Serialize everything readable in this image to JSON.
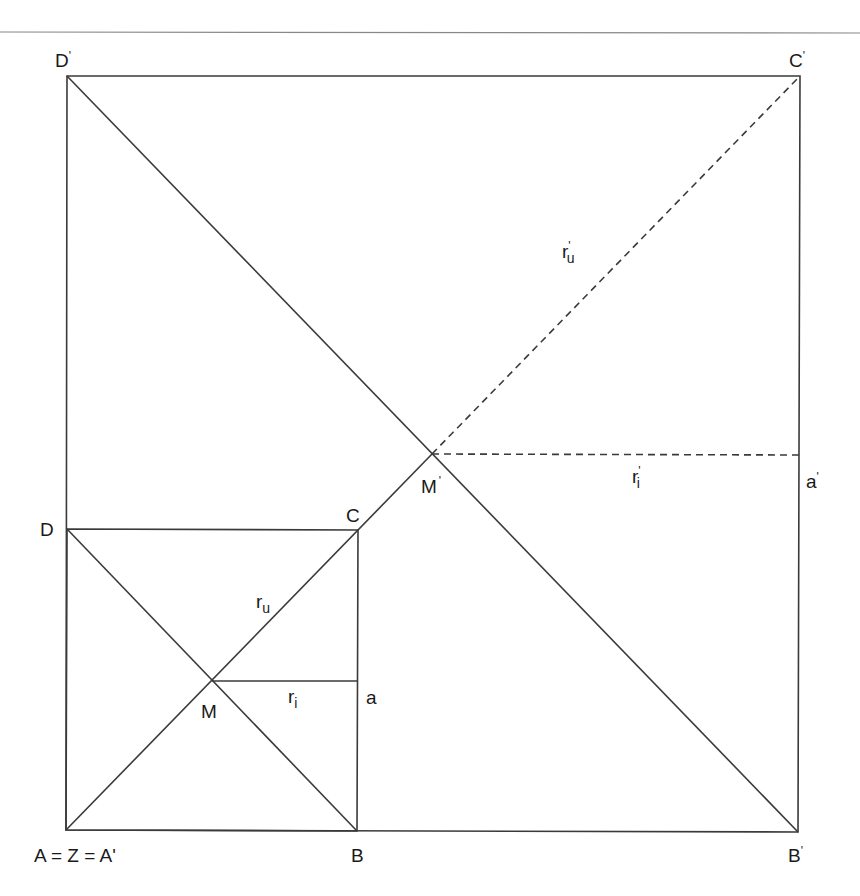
{
  "diagram": {
    "points": {
      "A": {
        "label": "A = Z = A'"
      },
      "B": {
        "label": "B"
      },
      "C": {
        "label": "C"
      },
      "D": {
        "label": "D"
      },
      "M": {
        "label": "M"
      },
      "B_prime": {
        "label": "B"
      },
      "C_prime": {
        "label": "C"
      },
      "D_prime": {
        "label": "D"
      },
      "M_prime": {
        "label": "M"
      }
    },
    "prime_mark": "'",
    "segments": {
      "r_i": {
        "base": "r",
        "sub": "i"
      },
      "r_u": {
        "base": "r",
        "sub": "u"
      },
      "a": {
        "label": "a"
      },
      "r_i_prime": {
        "base": "r",
        "sub": "i",
        "prime": "'"
      },
      "r_u_prime": {
        "base": "r",
        "sub": "u",
        "prime": "'"
      },
      "a_prime": {
        "label": "a",
        "prime": "'"
      }
    },
    "colors": {
      "line": "#3a3a3a",
      "text": "#1a1a1a"
    }
  }
}
